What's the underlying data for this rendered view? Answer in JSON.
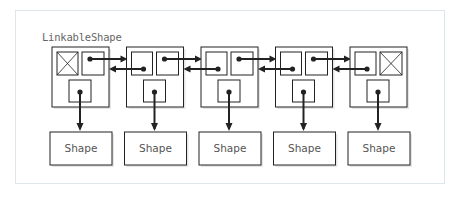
{
  "diagram": {
    "title": "LinkableShape",
    "nodes": [
      {
        "id": 1,
        "prev_null": true,
        "next_null": false,
        "shape_label": "Shape"
      },
      {
        "id": 2,
        "prev_null": false,
        "next_null": false,
        "shape_label": "Shape"
      },
      {
        "id": 3,
        "prev_null": false,
        "next_null": false,
        "shape_label": "Shape"
      },
      {
        "id": 4,
        "prev_null": false,
        "next_null": false,
        "shape_label": "Shape"
      },
      {
        "id": 5,
        "prev_null": false,
        "next_null": true,
        "shape_label": "Shape"
      }
    ],
    "colors": {
      "line": "#222222",
      "panel_border": "#dde7ea",
      "text": "#555555"
    }
  }
}
